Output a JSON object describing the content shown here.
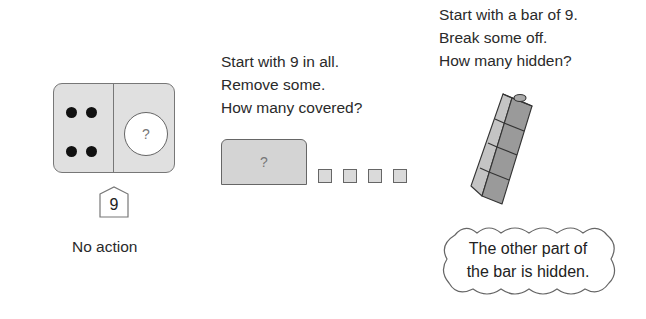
{
  "panels": [
    {
      "id": "part-part-whole",
      "dots_shown": 4,
      "hidden_label": "?",
      "whole_label": "9",
      "caption": "No action"
    },
    {
      "id": "covered",
      "prompt_lines": [
        "Start with 9 in all.",
        "Remove some.",
        "How many covered?"
      ],
      "cover_label": "?",
      "visible_squares": 4
    },
    {
      "id": "hidden-bar",
      "prompt_lines": [
        "Start with a bar of 9.",
        "Break some off.",
        "How many hidden?"
      ],
      "cubes_shown": 4,
      "cloud_lines": [
        "The other part of",
        "the bar is hidden."
      ]
    }
  ],
  "colors": {
    "mat_fill": "#e0e0e0",
    "cover_fill": "#d4d4d4",
    "cube_front": "#9a9a9a",
    "cube_side": "#c4c4c4",
    "outline": "#666666"
  }
}
